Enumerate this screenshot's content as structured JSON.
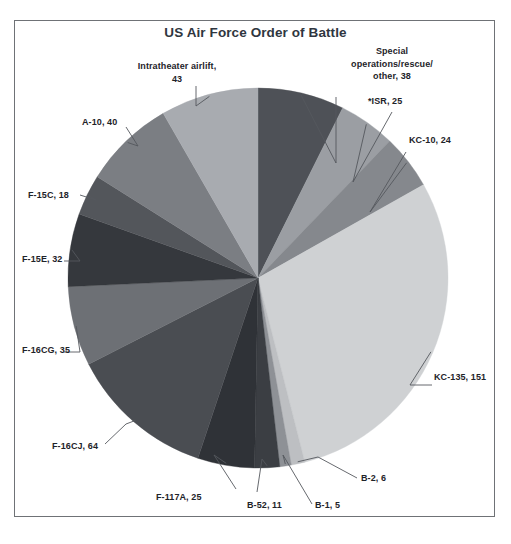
{
  "chart_data": {
    "type": "pie",
    "title": "US Air Force Order of Battle",
    "xlabel": "",
    "ylabel": "",
    "legend": "none",
    "grid": false,
    "start_angle_deg": 0,
    "direction": "clockwise",
    "total": 517,
    "categories": [
      "Special operations/rescue/other",
      "*ISR",
      "KC-10",
      "KC-135",
      "B-2",
      "B-1",
      "B-52",
      "F-117A",
      "F-16CJ",
      "F-16CG",
      "F-15E",
      "F-15C",
      "A-10",
      "Intratheater airlift"
    ],
    "values": [
      38,
      25,
      24,
      151,
      6,
      5,
      11,
      25,
      64,
      35,
      32,
      18,
      40,
      43
    ],
    "colors": [
      "#4e5157",
      "#9b9ea3",
      "#85888d",
      "#cfd1d3",
      "#bdbfc2",
      "#8e9196",
      "#3b3e43",
      "#2f3237",
      "#4a4d52",
      "#6d7075",
      "#35383d",
      "#53565b",
      "#7b7e83",
      "#a8abb0"
    ],
    "slices": [
      {
        "name": "Special operations/rescue/other",
        "value": 38,
        "label": "Special\noperations/rescue/\nother, 38",
        "color": "#4e5157"
      },
      {
        "name": "*ISR",
        "value": 25,
        "label": "*ISR, 25",
        "color": "#9b9ea3"
      },
      {
        "name": "KC-10",
        "value": 24,
        "label": "KC-10, 24",
        "color": "#85888d"
      },
      {
        "name": "KC-135",
        "value": 151,
        "label": "KC-135, 151",
        "color": "#cfd1d3"
      },
      {
        "name": "B-2",
        "value": 6,
        "label": "B-2, 6",
        "color": "#bdbfc2"
      },
      {
        "name": "B-1",
        "value": 5,
        "label": "B-1, 5",
        "color": "#8e9196"
      },
      {
        "name": "B-52",
        "value": 11,
        "label": "B-52, 11",
        "color": "#3b3e43"
      },
      {
        "name": "F-117A",
        "value": 25,
        "label": "F-117A, 25",
        "color": "#2f3237"
      },
      {
        "name": "F-16CJ",
        "value": 64,
        "label": "F-16CJ, 64",
        "color": "#4a4d52"
      },
      {
        "name": "F-16CG",
        "value": 35,
        "label": "F-16CG, 35",
        "color": "#6d7075"
      },
      {
        "name": "F-15E",
        "value": 32,
        "label": "F-15E, 32",
        "color": "#35383d"
      },
      {
        "name": "F-15C",
        "value": 18,
        "label": "F-15C, 18",
        "color": "#53565b"
      },
      {
        "name": "A-10",
        "value": 40,
        "label": "A-10, 40",
        "color": "#7b7e83"
      },
      {
        "name": "Intratheater airlift",
        "value": 43,
        "label": "Intratheater airlift,\n43",
        "color": "#a8abb0"
      }
    ]
  },
  "labels": {
    "special_ops": "Special\noperations/rescue/\nother, 38",
    "isr": "*ISR, 25",
    "kc10": "KC-10, 24",
    "kc135": "KC-135, 151",
    "b2": "B-2, 6",
    "b1": "B-1, 5",
    "b52": "B-52, 11",
    "f117a": "F-117A, 25",
    "f16cj": "F-16CJ, 64",
    "f16cg": "F-16CG, 35",
    "f15e": "F-15E, 32",
    "f15c": "F-15C, 18",
    "a10": "A-10, 40",
    "intratheater": "Intratheater airlift,\n43"
  },
  "style": {
    "frame_border_color": "#6f7276",
    "title_color": "#2f3640",
    "label_color": "#1e2329",
    "leader_color": "#55585d",
    "background": "#ffffff"
  }
}
